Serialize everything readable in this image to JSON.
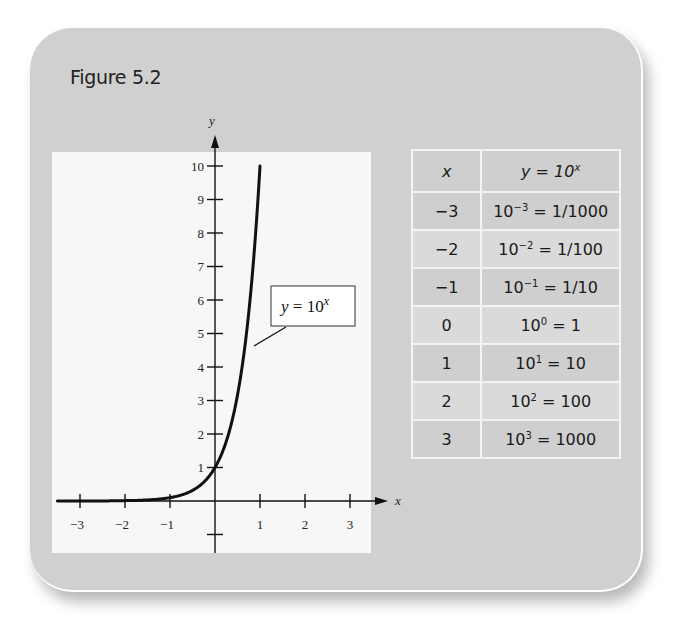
{
  "figure": {
    "title": "Figure 5.2"
  },
  "chart_data": {
    "type": "line",
    "title": "",
    "xlabel": "x",
    "ylabel": "y",
    "curve_label": "y = 10^x",
    "series": [
      {
        "name": "y = 10^x",
        "x": [
          -3.5,
          -3,
          -2,
          -1,
          -0.5,
          0,
          0.25,
          0.5,
          0.75,
          1,
          1.02
        ],
        "values": [
          0.0003,
          0.001,
          0.01,
          0.1,
          0.316,
          1,
          1.778,
          3.162,
          5.623,
          10,
          10.5
        ]
      }
    ],
    "xlim": [
      -3.5,
      3.5
    ],
    "ylim": [
      -1,
      10.5
    ],
    "x_ticks": [
      -3,
      -2,
      -1,
      1,
      2,
      3
    ],
    "x_tick_labels": [
      "−3",
      "−2",
      "−1",
      "1",
      "2",
      "3"
    ],
    "y_ticks": [
      1,
      2,
      3,
      4,
      5,
      6,
      7,
      8,
      9,
      10
    ],
    "y_tick_labels": [
      "1",
      "2",
      "3",
      "4",
      "5",
      "6",
      "7",
      "8",
      "9",
      "10"
    ],
    "grid": false,
    "legend": "none"
  },
  "table": {
    "header_x": "x",
    "header_y_base": "y = 10",
    "header_y_sup": "x",
    "rows": [
      {
        "x": "−3",
        "base": "10",
        "exp": "−3",
        "rhs": " = 1/1000"
      },
      {
        "x": "−2",
        "base": "10",
        "exp": "−2",
        "rhs": " = 1/100"
      },
      {
        "x": "−1",
        "base": "10",
        "exp": "−1",
        "rhs": " = 1/10"
      },
      {
        "x": "0",
        "base": "10",
        "exp": "0",
        "rhs": " = 1"
      },
      {
        "x": "1",
        "base": "10",
        "exp": "1",
        "rhs": " = 10"
      },
      {
        "x": "2",
        "base": "10",
        "exp": "2",
        "rhs": " = 100"
      },
      {
        "x": "3",
        "base": "10",
        "exp": "3",
        "rhs": " = 1000"
      }
    ]
  },
  "colors": {
    "card_bg": "#d0d0d0",
    "plot_bg": "#f7f7f7",
    "ink": "#111111"
  }
}
